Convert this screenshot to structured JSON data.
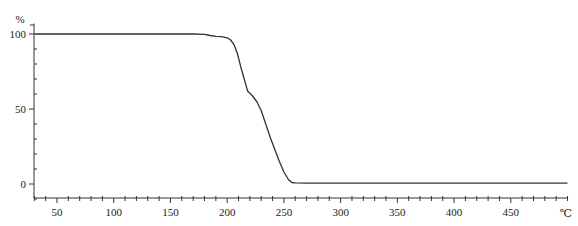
{
  "chart_data": {
    "type": "line",
    "title": "",
    "xlabel": "",
    "ylabel": "",
    "y_unit_label": "%",
    "x_unit_label": "℃",
    "xlim": [
      30,
      500
    ],
    "ylim": [
      -10,
      107
    ],
    "x_ticks": [
      50,
      100,
      150,
      200,
      250,
      300,
      350,
      400,
      450
    ],
    "x_minor_step": 10,
    "y_ticks": [
      0,
      50,
      100
    ],
    "y_minor_step": 10,
    "grid": false,
    "legend": null,
    "series": [
      {
        "name": "TGA weight loss",
        "color": "#333333",
        "x": [
          30,
          100,
          170,
          180,
          185,
          190,
          195,
          200,
          203,
          206,
          209,
          212,
          215,
          218,
          222,
          226,
          230,
          234,
          238,
          242,
          246,
          250,
          254,
          257,
          260,
          270,
          300,
          350,
          400,
          450,
          500
        ],
        "y": [
          100,
          100,
          100,
          99.8,
          99,
          98.5,
          98.2,
          97.5,
          96,
          93,
          87,
          78,
          70,
          62,
          59,
          55,
          49,
          40,
          31,
          23,
          15,
          8,
          3,
          1,
          0.7,
          0.6,
          0.6,
          0.6,
          0.6,
          0.6,
          0.6
        ]
      }
    ]
  }
}
